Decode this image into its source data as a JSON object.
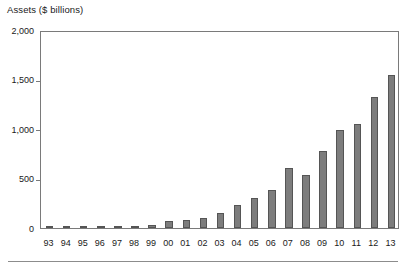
{
  "chart_data": {
    "type": "bar",
    "title": "Assets ($ billions)",
    "xlabel": "",
    "ylabel": "",
    "categories": [
      "93",
      "94",
      "95",
      "96",
      "97",
      "98",
      "99",
      "00",
      "01",
      "02",
      "03",
      "04",
      "05",
      "06",
      "07",
      "08",
      "09",
      "10",
      "11",
      "12",
      "13"
    ],
    "values": [
      2,
      3,
      5,
      9,
      13,
      18,
      26,
      66,
      83,
      102,
      151,
      228,
      301,
      384,
      608,
      531,
      777,
      988,
      1048,
      1323,
      1545
    ],
    "ylim": [
      0,
      2000
    ],
    "yticks": [
      0,
      500,
      1000,
      1500,
      2000
    ],
    "ytick_labels": [
      "0",
      "500",
      "1,000",
      "1,500",
      "2,000"
    ],
    "grid": false,
    "legend": "none",
    "bar_color": "#7d7d7d",
    "bar_edge_color": "#555555",
    "axis_color": "#7a7a7a",
    "background": "#ffffff"
  }
}
